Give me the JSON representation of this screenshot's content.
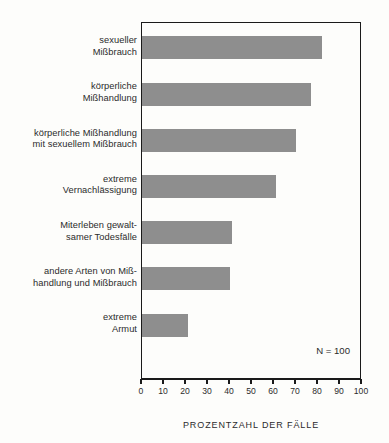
{
  "chart_data": {
    "type": "bar",
    "orientation": "horizontal",
    "title": "",
    "subtitle": "",
    "xlabel": "PROZENTZAHL DER FÄLLE",
    "ylabel": "",
    "xlim": [
      0,
      100
    ],
    "xticks": [
      0,
      10,
      20,
      30,
      40,
      50,
      60,
      70,
      80,
      90,
      100
    ],
    "xtick_labels": [
      "0",
      "10",
      "20",
      "30",
      "40",
      "50",
      "60",
      "70",
      "80",
      "90",
      "100"
    ],
    "grid": false,
    "legend": null,
    "bar_color": "#8e8e8e",
    "axis_color": "#1a1a1a",
    "background_color": "#fdfdfb",
    "categories": [
      "sexueller Mißbrauch",
      "körperliche Mißhandlung",
      "körperliche Mißhandlung mit sexuellem Mißbrauch",
      "extreme Vernachlässigung",
      "Miterleben gewaltsamer Todesfälle",
      "andere Arten von Mißhandlung und Mißbrauch",
      "extreme Armut"
    ],
    "category_lines": [
      [
        "sexueller",
        "Mißbrauch"
      ],
      [
        "körperliche",
        "Mißhandlung"
      ],
      [
        "körperliche Mißhandlung",
        "mit sexuellem Mißbrauch"
      ],
      [
        "extreme",
        "Vernachlässigung"
      ],
      [
        "Miterleben gewalt-",
        "samer Todesfälle"
      ],
      [
        "andere Arten von Miß-",
        "handlung und Mißbrauch"
      ],
      [
        "extreme",
        "Armut"
      ]
    ],
    "values": [
      82,
      77,
      70,
      61,
      41,
      40,
      21
    ],
    "annotations": [
      {
        "name": "sample-size",
        "text": "N = 100"
      }
    ]
  }
}
